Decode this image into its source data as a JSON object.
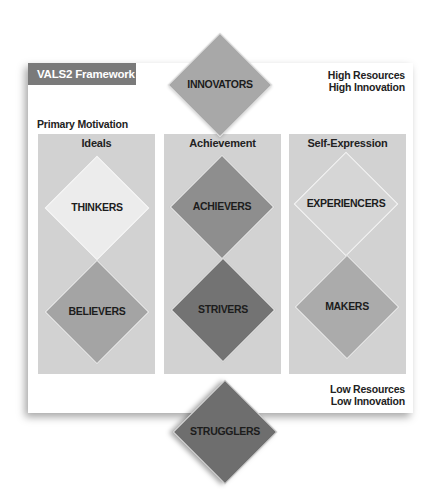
{
  "framework": {
    "title": "VALS2 Framework",
    "top_right": [
      "High Resources",
      "High Innovation"
    ],
    "bottom_right": [
      "Low Resources",
      "Low Innovation"
    ],
    "axis_label": "Primary Motivation"
  },
  "columns": [
    {
      "title": "Ideals"
    },
    {
      "title": "Achievement"
    },
    {
      "title": "Self-Expression"
    }
  ],
  "segments": {
    "innovators": {
      "label": "INNOVATORS",
      "color": "#a8a8a8"
    },
    "thinkers": {
      "label": "THINKERS",
      "color": "#ececec"
    },
    "believers": {
      "label": "BELIEVERS",
      "color": "#a4a4a4"
    },
    "achievers": {
      "label": "ACHIEVERS",
      "color": "#8e8e8e"
    },
    "strivers": {
      "label": "STRIVERS",
      "color": "#737373"
    },
    "experiencers": {
      "label": "EXPERIENCERS",
      "color": "#d6d6d6"
    },
    "makers": {
      "label": "MAKERS",
      "color": "#ababab"
    },
    "strugglers": {
      "label": "STRUGGLERS",
      "color": "#6e6e6e"
    }
  },
  "colors": {
    "header_bar": "#7a7a7a",
    "column_bg": "#d2d2d2",
    "diamond_border": "#f2f2f2"
  }
}
